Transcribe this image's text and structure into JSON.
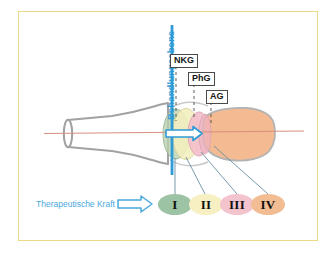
{
  "figure": {
    "plane_label": "Behandlungsebene",
    "force_label": "Therapeutische Kraft",
    "frame_color": "#ecd98a",
    "plane_color": "#2e9bd6",
    "axis_color": "#d98f7e",
    "bone_outline_color": "#9e9e9e",
    "leader_color": "#5b7e95"
  },
  "abbreviations": [
    {
      "id": "nkg",
      "label": "NKG",
      "x": 176,
      "y": 55
    },
    {
      "id": "phg",
      "label": "PhG",
      "x": 194,
      "y": 73
    },
    {
      "id": "ag",
      "label": "AG",
      "x": 210,
      "y": 91
    }
  ],
  "grades": [
    {
      "roman": "I",
      "color": "#9cc3a4",
      "text_color": "#111111"
    },
    {
      "roman": "II",
      "color": "#f6f0c3",
      "text_color": "#111111"
    },
    {
      "roman": "III",
      "color": "#f3c3ce",
      "text_color": "#111111"
    },
    {
      "roman": "IV",
      "color": "#f3bd93",
      "text_color": "#111111"
    }
  ],
  "joint_layers": [
    {
      "id": "layer-i",
      "name": "grade-i-zone",
      "color": "#b9cfae"
    },
    {
      "id": "layer-ii",
      "name": "grade-ii-zone",
      "color": "#f4efbe"
    },
    {
      "id": "layer-iii",
      "name": "grade-iii-zone",
      "color": "#f2bdc9"
    },
    {
      "id": "layer-iv",
      "name": "grade-iv-bone",
      "color": "#f3b489"
    }
  ],
  "icons": {
    "force_arrow": "right-arrow-outline",
    "joint_arrow": "right-arrow-outline"
  }
}
